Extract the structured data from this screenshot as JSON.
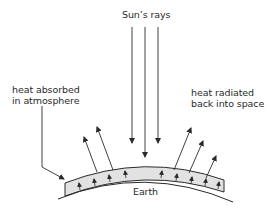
{
  "diagram": {
    "labels": {
      "sun_rays": "Sun’s rays",
      "absorbed_line1": "heat absorbed",
      "absorbed_line2": "in atmosphere",
      "radiated_line1": "heat radiated",
      "radiated_line2": "back into space",
      "earth": "Earth"
    },
    "colors": {
      "line": "#2a2a2a",
      "atmosphere_fill": "#e2e2e2",
      "background": "#ffffff"
    },
    "elements": {
      "incoming_rays": 3,
      "outgoing_arrows_left": 2,
      "outgoing_arrows_right": 3,
      "trapped_arrows_in_atmosphere": 9
    }
  }
}
